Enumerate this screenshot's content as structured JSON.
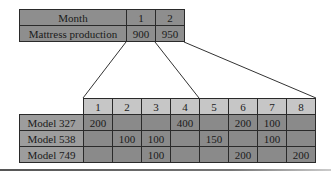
{
  "summary_table": {
    "header": [
      "Month",
      "1",
      "2"
    ],
    "row": [
      "Mattress production",
      "900",
      "950"
    ]
  },
  "detail_table": {
    "columns": [
      "1",
      "2",
      "3",
      "4",
      "5",
      "6",
      "7",
      "8"
    ],
    "rows": [
      {
        "label": "Model 327",
        "values": [
          "200",
          "",
          "",
          "400",
          "",
          "200",
          "100",
          ""
        ]
      },
      {
        "label": "Model 538",
        "values": [
          "",
          "100",
          "100",
          "",
          "150",
          "",
          "100",
          ""
        ]
      },
      {
        "label": "Model 749",
        "values": [
          "",
          "",
          "100",
          "",
          "",
          "200",
          "",
          "200"
        ]
      }
    ]
  },
  "colors": {
    "summary_fill": "#8e8e8e",
    "column_header_fill": "#c6c6c6",
    "row_label_fill": "#9d9d9d",
    "cell_fill": "#8a8a8a"
  }
}
